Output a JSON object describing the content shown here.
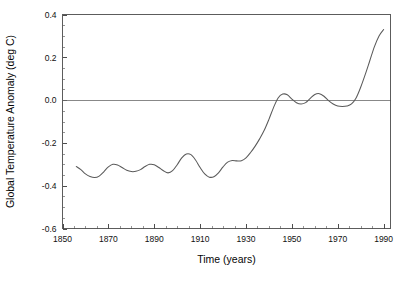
{
  "chart_data": {
    "type": "line",
    "title": "",
    "xlabel": "Time (years)",
    "ylabel": "Global Temperature Anomaly (deg C)",
    "xlim": [
      1850,
      1993
    ],
    "ylim": [
      -0.6,
      0.4
    ],
    "grid": false,
    "legend": null,
    "reference_lines": [
      {
        "axis": "y",
        "value": 0.0
      }
    ],
    "xticks": [
      1850,
      1870,
      1890,
      1910,
      1930,
      1950,
      1970,
      1990
    ],
    "xtick_labels": [
      "1850",
      "1870",
      "1890",
      "1910",
      "1930",
      "1950",
      "1970",
      "1990"
    ],
    "xtick_minor_step": 5,
    "yticks": [
      0.4,
      0.2,
      0.0,
      -0.2,
      -0.4,
      -0.6
    ],
    "ytick_labels": [
      "0.4",
      "0.2",
      "0.0",
      "-0.2",
      "-0.4",
      "-0.6"
    ],
    "ytick_minor_step": 0.05,
    "series": [
      {
        "name": "Global Temperature Anomaly",
        "color": "#5a5a5a",
        "x": [
          1856,
          1858,
          1860,
          1862,
          1864,
          1866,
          1868,
          1870,
          1872,
          1874,
          1876,
          1878,
          1880,
          1882,
          1884,
          1886,
          1888,
          1890,
          1892,
          1894,
          1896,
          1898,
          1900,
          1902,
          1904,
          1906,
          1908,
          1910,
          1912,
          1914,
          1916,
          1918,
          1920,
          1922,
          1924,
          1926,
          1928,
          1930,
          1932,
          1934,
          1936,
          1938,
          1940,
          1942,
          1944,
          1946,
          1948,
          1950,
          1952,
          1954,
          1956,
          1958,
          1960,
          1962,
          1964,
          1966,
          1968,
          1970,
          1972,
          1974,
          1976,
          1978,
          1980,
          1982,
          1984,
          1986,
          1988,
          1990
        ],
        "y": [
          -0.31,
          -0.325,
          -0.345,
          -0.357,
          -0.362,
          -0.355,
          -0.335,
          -0.312,
          -0.3,
          -0.303,
          -0.315,
          -0.328,
          -0.334,
          -0.333,
          -0.325,
          -0.31,
          -0.3,
          -0.302,
          -0.315,
          -0.33,
          -0.34,
          -0.33,
          -0.302,
          -0.27,
          -0.252,
          -0.255,
          -0.28,
          -0.315,
          -0.345,
          -0.36,
          -0.358,
          -0.34,
          -0.312,
          -0.29,
          -0.282,
          -0.284,
          -0.283,
          -0.27,
          -0.245,
          -0.215,
          -0.18,
          -0.14,
          -0.09,
          -0.035,
          0.01,
          0.028,
          0.025,
          0.005,
          -0.012,
          -0.018,
          -0.012,
          0.008,
          0.026,
          0.03,
          0.018,
          -0.002,
          -0.018,
          -0.028,
          -0.03,
          -0.028,
          -0.018,
          0.01,
          0.06,
          0.12,
          0.185,
          0.25,
          0.3,
          0.33
        ]
      }
    ]
  }
}
